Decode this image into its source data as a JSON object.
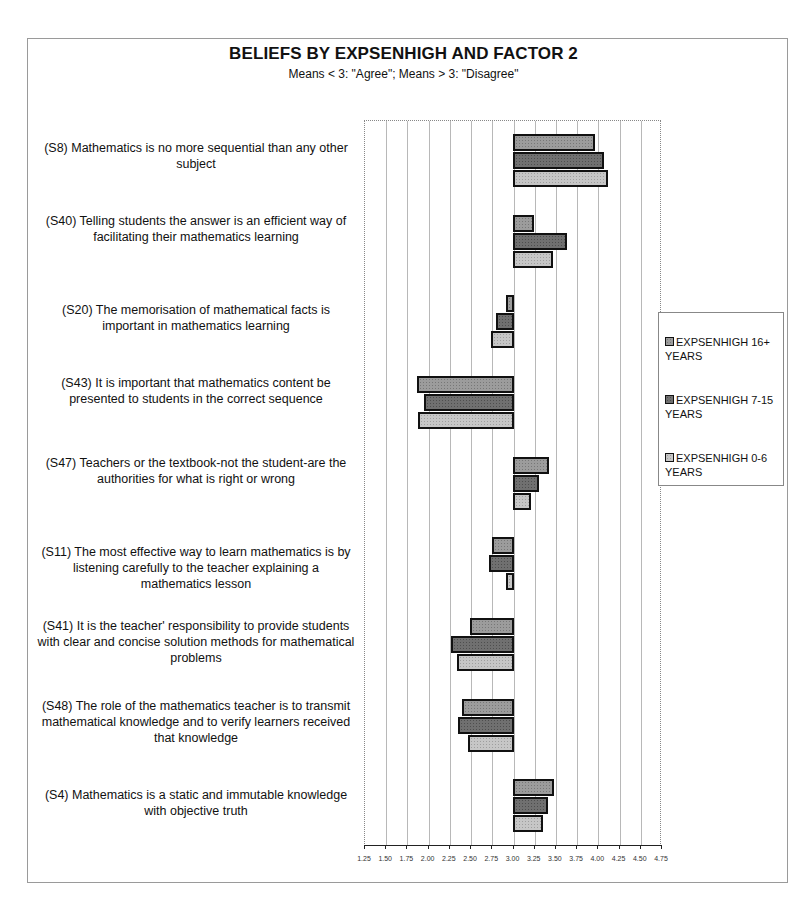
{
  "header": {
    "title": "BELIEFS BY EXPSENHIGH AND FACTOR 2",
    "subtitle": "Means < 3: \"Agree\"; Means > 3: \"Disagree\""
  },
  "legend": {
    "items": [
      {
        "label": "EXPSENHIGH 16+ YEARS",
        "color": "#9c9c9c"
      },
      {
        "label": "EXPSENHIGH 7-15 YEARS",
        "color": "#707070"
      },
      {
        "label": "EXPSENHIGH 0-6 YEARS",
        "color": "#c6c6c6"
      }
    ]
  },
  "axis": {
    "ticks": [
      "1.25",
      "1.50",
      "1.75",
      "2.00",
      "2.25",
      "2.50",
      "2.75",
      "3.00",
      "3.25",
      "3.50",
      "3.75",
      "4.00",
      "4.25",
      "4.50",
      "4.75"
    ]
  },
  "categories": [
    {
      "label": "(S8) Mathematics is no more sequential than any other subject"
    },
    {
      "label": "(S40) Telling students the answer is an efficient way of facilitating their mathematics learning"
    },
    {
      "label": "(S20) The memorisation of mathematical facts is important in mathematics learning"
    },
    {
      "label": "(S43) It is important that mathematics content be presented to students in the correct sequence"
    },
    {
      "label": "(S47) Teachers or the textbook-not the student-are the authorities for what is right or wrong"
    },
    {
      "label": "(S11) The most effective way to learn mathematics is by listening carefully to the teacher explaining a mathematics lesson"
    },
    {
      "label": "(S41) It is the teacher' responsibility to provide students with clear and concise solution methods for mathematical problems"
    },
    {
      "label": "(S48) The role of the mathematics teacher is to transmit mathematical knowledge and to verify learners  received that knowledge"
    },
    {
      "label": "(S4) Mathematics is a static and immutable knowledge with objective truth"
    }
  ],
  "chart_data": {
    "type": "bar",
    "orientation": "horizontal",
    "title": "BELIEFS BY EXPSENHIGH AND FACTOR 2",
    "subtitle": "Means < 3: \"Agree\"; Means > 3: \"Disagree\"",
    "xlabel": "",
    "ylabel": "",
    "baseline": 3.0,
    "xlim": [
      1.25,
      4.75
    ],
    "xticks": [
      1.25,
      1.5,
      1.75,
      2.0,
      2.25,
      2.5,
      2.75,
      3.0,
      3.25,
      3.5,
      3.75,
      4.0,
      4.25,
      4.5,
      4.75
    ],
    "grid": true,
    "legend_position": "right",
    "categories": [
      "S8",
      "S40",
      "S20",
      "S43",
      "S47",
      "S11",
      "S41",
      "S48",
      "S4"
    ],
    "series": [
      {
        "name": "EXPSENHIGH 16+ YEARS",
        "values": [
          3.95,
          3.23,
          2.92,
          1.88,
          3.41,
          2.76,
          2.5,
          2.4,
          3.46
        ]
      },
      {
        "name": "EXPSENHIGH 7-15 YEARS",
        "values": [
          4.05,
          3.62,
          2.8,
          1.96,
          3.29,
          2.72,
          2.27,
          2.36,
          3.39
        ]
      },
      {
        "name": "EXPSENHIGH 0-6 YEARS",
        "values": [
          4.1,
          3.45,
          2.75,
          1.89,
          3.2,
          2.92,
          2.35,
          2.47,
          3.34
        ]
      }
    ]
  }
}
